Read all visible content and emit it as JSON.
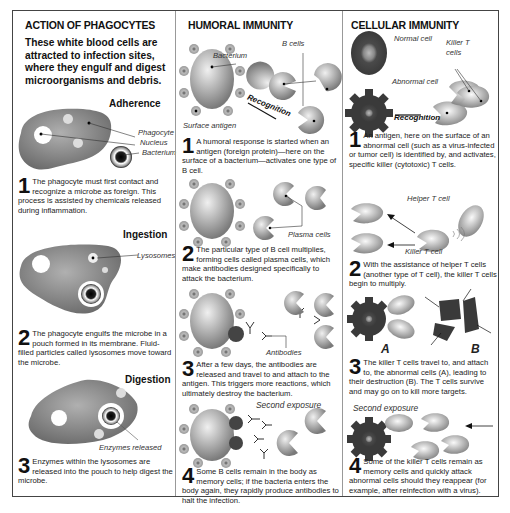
{
  "phagocytes": {
    "title": "ACTION OF PHAGOCYTES",
    "intro": "These white blood cells are attracted to infection sites, where they engulf and digest microorganisms and debris.",
    "stages": [
      {
        "heading": "Adherence",
        "labels": [
          "Phagocyte",
          "Nucleus",
          "Bacterium"
        ],
        "number": "1",
        "text": "The phagocyte must first contact and recognize a microbe as foreign. This process is assisted by chemicals released during inflammation."
      },
      {
        "heading": "Ingestion",
        "labels": [
          "Lysosomes"
        ],
        "number": "2",
        "text": "The phagocyte engulfs the microbe in a pouch formed in its membrane. Fluid-filled particles called lysosomes move toward the microbe."
      },
      {
        "heading": "Digestion",
        "labels": [
          "Enzymes released"
        ],
        "number": "3",
        "text": "Enzymes within the lysosomes are released into the pouch to help digest the microbe."
      }
    ]
  },
  "humoral": {
    "title": "HUMORAL IMMUNITY",
    "labels": {
      "b_cells": "B cells",
      "bacterium": "Bacterium",
      "surface_antigen": "Surface antigen",
      "recognition": "Recognition",
      "plasma_cells": "Plasma cells",
      "antibodies": "Antibodies",
      "second_exposure": "Second exposure"
    },
    "steps": [
      {
        "number": "1",
        "text": "A humoral response is started when an antigen (foreign protein)—here on the surface of a bacterium—activates one type of B cell."
      },
      {
        "number": "2",
        "text": "The particular type of B cell multiplies, forming cells called plasma cells, which make antibodies designed specifically to attack the bacterium."
      },
      {
        "number": "3",
        "text": "After a few days, the antibodies are released and travel to and attach to the antigen. This triggers more reactions, which ultimately destroy the bacterium."
      },
      {
        "number": "4",
        "text": "Some B cells remain in the body as memory cells; if the bacteria enters the body again, they rapidly produce antibodies to halt the infection."
      }
    ]
  },
  "cellular": {
    "title": "CELLULAR IMMUNITY",
    "labels": {
      "normal_cell": "Normal cell",
      "killer_t_cells": "Killer T cells",
      "abnormal_cell": "Abnormal cell",
      "recognition": "Recognition",
      "helper_t_cell": "Helper T cell",
      "killer_t_cell": "Killer T cell",
      "a": "A",
      "b": "B",
      "second_exposure": "Second exposure"
    },
    "steps": [
      {
        "number": "1",
        "text": "An antigen, here on the surface of an abnormal cell (such as a virus-infected or tumor cell) is identified by, and activates, specific killer (cytotoxic) T cells."
      },
      {
        "number": "2",
        "text": "With the assistance of helper T cells (another type of T cell), the killer T cells begin to multiply."
      },
      {
        "number": "3",
        "text": "The killer T cells travel to, and attach to, the abnormal cells (A), leading to their destruction (B). The T cells survive and may go on to kill more targets."
      },
      {
        "number": "4",
        "text": "Some of the killer T cells remain as memory cells and quickly attack abnormal cells should they reappear (for example, after reinfection with a virus)."
      }
    ]
  },
  "colors": {
    "frame": "#444444",
    "cell_gray": "#8a8a8a",
    "dark_cell": "#555555",
    "text": "#222222"
  }
}
